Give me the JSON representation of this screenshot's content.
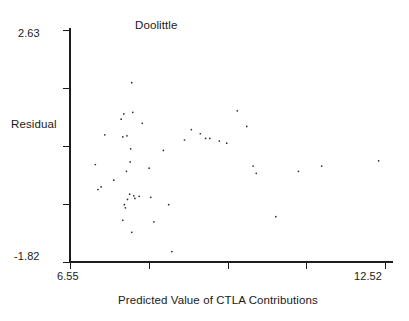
{
  "chart_data": {
    "type": "scatter",
    "title": "Doolittle",
    "xlabel": "Predicted Value of CTLA Contributions",
    "ylabel": "Residual",
    "xlim": [
      6.55,
      12.52
    ],
    "ylim": [
      -1.82,
      2.63
    ],
    "xtick_labels": [
      "6.55",
      "12.52"
    ],
    "ytick_labels": [
      "2.63",
      "-1.82"
    ],
    "x_tick_count": 5,
    "y_tick_count": 5,
    "grid": false,
    "legend": null,
    "marker_color": "#2a2a2a",
    "axis_color": "#1d1d1d",
    "background": "#ffffff",
    "points": [
      [
        7.21,
        0.62
      ],
      [
        7.03,
        0.05
      ],
      [
        7.14,
        -0.38
      ],
      [
        7.08,
        -0.43
      ],
      [
        7.38,
        -0.25
      ],
      [
        7.52,
        0.92
      ],
      [
        7.57,
        1.02
      ],
      [
        7.63,
        0.6
      ],
      [
        7.55,
        0.58
      ],
      [
        7.72,
        1.62
      ],
      [
        7.74,
        1.05
      ],
      [
        7.7,
        0.35
      ],
      [
        7.69,
        0.1
      ],
      [
        7.62,
        -0.08
      ],
      [
        7.68,
        -0.52
      ],
      [
        7.76,
        -0.55
      ],
      [
        7.58,
        -0.72
      ],
      [
        7.6,
        -0.78
      ],
      [
        7.64,
        -0.62
      ],
      [
        7.55,
        -1.02
      ],
      [
        7.72,
        -1.25
      ],
      [
        7.78,
        -0.6
      ],
      [
        7.86,
        -0.56
      ],
      [
        7.92,
        0.84
      ],
      [
        8.05,
        -0.02
      ],
      [
        8.08,
        -0.58
      ],
      [
        8.14,
        -1.05
      ],
      [
        8.32,
        0.32
      ],
      [
        8.42,
        -0.72
      ],
      [
        8.48,
        -1.62
      ],
      [
        8.72,
        0.52
      ],
      [
        8.85,
        0.72
      ],
      [
        9.02,
        0.64
      ],
      [
        9.12,
        0.55
      ],
      [
        9.2,
        0.55
      ],
      [
        9.38,
        0.5
      ],
      [
        9.52,
        0.46
      ],
      [
        9.72,
        1.08
      ],
      [
        9.9,
        0.78
      ],
      [
        10.02,
        0.02
      ],
      [
        10.08,
        -0.12
      ],
      [
        10.45,
        -0.95
      ],
      [
        10.88,
        -0.08
      ],
      [
        11.32,
        0.02
      ],
      [
        12.4,
        0.12
      ]
    ]
  }
}
